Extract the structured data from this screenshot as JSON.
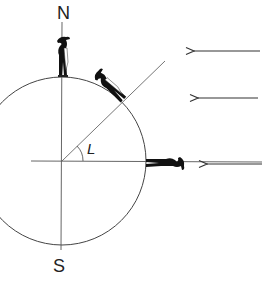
{
  "diagram": {
    "labels": {
      "north": "N",
      "south": "S",
      "angle": "L"
    },
    "elements": {
      "earth_circle": {
        "cx": 62,
        "cy": 161,
        "r": 84
      },
      "axis_vertical": {
        "x": 62,
        "y1": 20,
        "y2": 250
      },
      "axis_horizontal": {
        "y": 161,
        "x1": 31,
        "x2": 262
      },
      "latitude_line": {
        "x1": 62,
        "y1": 161,
        "x2": 163,
        "y2": 62,
        "angle_deg": 45
      },
      "sun_rays": [
        {
          "x1": 260,
          "y1": 51,
          "x2": 193,
          "y2": 51
        },
        {
          "x1": 258,
          "y1": 98,
          "x2": 197,
          "y2": 98
        },
        {
          "x1": 262,
          "y1": 164,
          "x2": 206,
          "y2": 164
        }
      ],
      "observers": [
        {
          "position": "north-pole",
          "x": 62,
          "y": 76
        },
        {
          "position": "mid-latitude",
          "x": 122,
          "y": 101
        },
        {
          "position": "equator",
          "x": 146,
          "y": 161
        }
      ]
    },
    "colors": {
      "line": "#444444",
      "figure": "#111111",
      "background": "#ffffff"
    }
  }
}
